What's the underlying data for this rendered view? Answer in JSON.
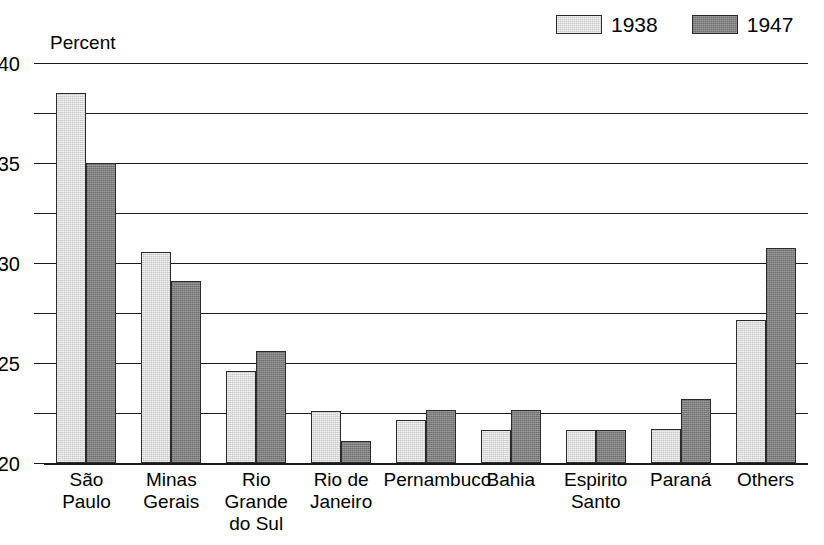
{
  "chart_data": {
    "type": "bar",
    "title": "",
    "subtitle": "",
    "xlabel": "",
    "ylabel": "Percent",
    "ylim": [
      0,
      40
    ],
    "ytick_step": 5,
    "yticks": [
      0,
      5,
      10,
      15,
      20,
      25,
      30,
      35,
      40
    ],
    "ytick_labels": [
      "0",
      "5",
      "10",
      "15",
      "20",
      "25",
      "30",
      "35",
      "40"
    ],
    "grid": true,
    "grid_orientation": "horizontal",
    "legend_position": "top-right",
    "categories": [
      "São\nPaulo",
      "Minas\nGerais",
      "Rio\nGrande\ndo Sul",
      "Rio de\nJaneiro",
      "Pernambuco",
      "Bahia",
      "Espirito\nSanto",
      "Paraná",
      "Others"
    ],
    "series": [
      {
        "name": "1938",
        "color": "#c9c9c9",
        "values": [
          37.0,
          21.1,
          9.2,
          5.2,
          4.3,
          3.3,
          3.3,
          3.4,
          14.3
        ]
      },
      {
        "name": "1947",
        "color": "#7e7e7e",
        "values": [
          30.0,
          18.2,
          11.2,
          2.2,
          5.3,
          5.3,
          3.3,
          6.4,
          21.5
        ]
      }
    ]
  },
  "legend": {
    "entries": [
      {
        "label": "1938",
        "swatch": "light-gray-swatch"
      },
      {
        "label": "1947",
        "swatch": "dark-gray-swatch"
      }
    ]
  },
  "axis": {
    "y_title": "Percent"
  },
  "colors": {
    "series_1938": "#c9c9c9",
    "series_1947": "#7e7e7e",
    "axis_line": "#1a1a1a",
    "bar_border": "#2b2b2b",
    "background": "#ffffff"
  }
}
